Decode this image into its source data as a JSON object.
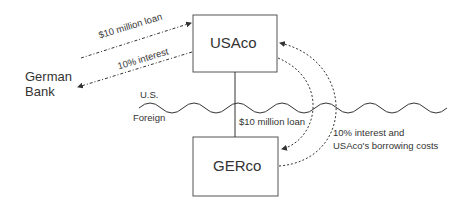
{
  "entities": {
    "usaco": "USAco",
    "gerco": "GERco",
    "german_bank_line1": "German",
    "german_bank_line2": "Bank"
  },
  "regions": {
    "us": "U.S.",
    "foreign": "Foreign"
  },
  "flows": {
    "bank_loan": "$10 million loan",
    "bank_interest": "10% interest",
    "intercompany_loan": "$10 million loan",
    "return_line1": "10% interest and",
    "return_line2": "USAco's borrowing costs"
  },
  "colors": {
    "line": "#333333",
    "text": "#222222",
    "background": "#ffffff"
  }
}
